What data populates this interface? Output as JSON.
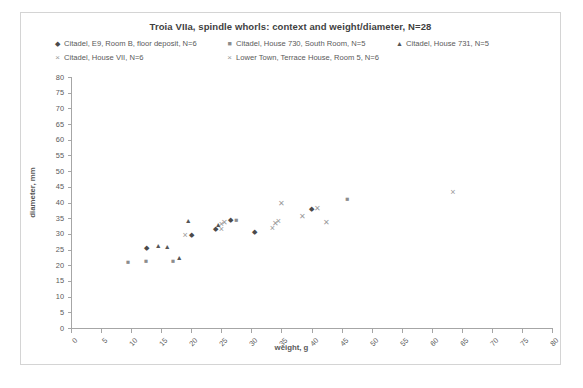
{
  "chart_data": {
    "type": "scatter",
    "title": "Troia VIIa, spindle whorls:  context and weight/diameter, N=28",
    "xlabel": "weight, g",
    "ylabel": "diameter, mm",
    "xlim": [
      0,
      80
    ],
    "ylim": [
      0,
      80
    ],
    "xticks": [
      "0",
      "5",
      "10",
      "15",
      "20",
      "25",
      "30",
      "35",
      "40",
      "45",
      "50",
      "55",
      "60",
      "65",
      "70",
      "75",
      "80"
    ],
    "yticks": [
      "0",
      "5",
      "10",
      "15",
      "20",
      "25",
      "30",
      "35",
      "40",
      "45",
      "50",
      "55",
      "60",
      "65",
      "70",
      "75",
      "80"
    ],
    "grid": false,
    "legend_position": "top",
    "series": [
      {
        "name": "Citadel, E9, Room B, floor deposit, N=6",
        "marker": "diamond",
        "color": "#4a4a4a",
        "points": [
          {
            "x": 12.6,
            "y": 25.5
          },
          {
            "x": 20.0,
            "y": 29.5
          },
          {
            "x": 24.0,
            "y": 31.5
          },
          {
            "x": 26.5,
            "y": 34.5
          },
          {
            "x": 30.5,
            "y": 30.5
          },
          {
            "x": 40.0,
            "y": 38.0
          }
        ]
      },
      {
        "name": "Citadel, House 730, South Room, N=5",
        "marker": "square",
        "color": "#8c8c8c",
        "points": [
          {
            "x": 9.5,
            "y": 21.0
          },
          {
            "x": 12.5,
            "y": 21.5
          },
          {
            "x": 17.0,
            "y": 21.5
          },
          {
            "x": 27.5,
            "y": 34.5
          },
          {
            "x": 46.0,
            "y": 41.0
          }
        ]
      },
      {
        "name": "Citadel, House 731, N=5",
        "marker": "triangle",
        "color": "#555555",
        "points": [
          {
            "x": 14.5,
            "y": 26.5
          },
          {
            "x": 16.0,
            "y": 26.0
          },
          {
            "x": 18.0,
            "y": 22.5
          },
          {
            "x": 19.5,
            "y": 34.5
          },
          {
            "x": 24.5,
            "y": 33.0
          }
        ]
      },
      {
        "name": "Citadel, House VII, N=6",
        "marker": "x-thin",
        "color": "#9a9a9a",
        "points": [
          {
            "x": 19.0,
            "y": 29.5
          },
          {
            "x": 25.0,
            "y": 33.0
          },
          {
            "x": 25.0,
            "y": 31.5
          },
          {
            "x": 33.5,
            "y": 32.0
          },
          {
            "x": 34.5,
            "y": 34.0
          },
          {
            "x": 63.5,
            "y": 43.5
          }
        ]
      },
      {
        "name": "Lower Town, Terrace House, Room 5, N=6",
        "marker": "x-bold",
        "color": "#9a9a9a",
        "points": [
          {
            "x": 25.5,
            "y": 33.5
          },
          {
            "x": 34.0,
            "y": 33.0
          },
          {
            "x": 35.0,
            "y": 39.5
          },
          {
            "x": 38.5,
            "y": 35.5
          },
          {
            "x": 41.0,
            "y": 38.0
          },
          {
            "x": 42.5,
            "y": 33.5
          }
        ]
      }
    ]
  },
  "legend": {
    "items": [
      {
        "label": "Citadel, E9, Room B, floor deposit, N=6",
        "glyph": "◆",
        "name": "legend-marker-diamond-icon"
      },
      {
        "label": "Citadel, House 730, South Room, N=5",
        "glyph": "■",
        "name": "legend-marker-square-icon"
      },
      {
        "label": "Citadel, House 731, N=5",
        "glyph": "▲",
        "name": "legend-marker-triangle-icon"
      },
      {
        "label": "Citadel, House VII, N=6",
        "glyph": "×",
        "name": "legend-marker-x-thin-icon"
      },
      {
        "label": "Lower Town, Terrace House, Room 5, N=6",
        "glyph": "×",
        "name": "legend-marker-x-bold-icon"
      }
    ]
  }
}
